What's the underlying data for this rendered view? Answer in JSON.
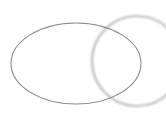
{
  "canvas": {
    "width": 166,
    "height": 114,
    "background": "#ffffff"
  },
  "shapes": {
    "ellipse": {
      "cx": 76,
      "cy": 63.5,
      "rx": 65,
      "ry": 40.5,
      "stroke": "#8a8a8a",
      "stroke_width": 1.1
    },
    "circle": {
      "cx": 137,
      "cy": 61,
      "r": 45,
      "stroke": "#bdbdbd",
      "stroke_width": 2.2,
      "blur": 0.9
    }
  }
}
